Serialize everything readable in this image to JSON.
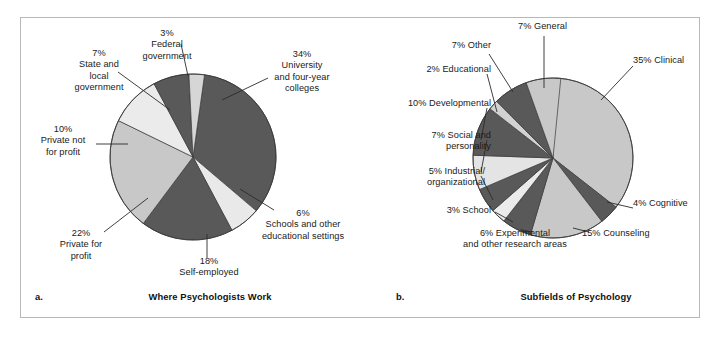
{
  "figure": {
    "background": "#ffffff",
    "frame_color": "#b8b8b8"
  },
  "panels": [
    {
      "letter": "a.",
      "caption": "Where Psychologists Work"
    },
    {
      "letter": "b.",
      "caption": "Subfields of Psychology"
    }
  ],
  "chart_data": [
    {
      "type": "pie",
      "title": "Where Psychologists Work",
      "panel": "a.",
      "units": "percent",
      "total": 100,
      "legend_position": "callout-labels",
      "categories": [
        "University and four-year colleges",
        "Schools and other educational settings",
        "Self-employed",
        "Private for profit",
        "Private not for profit",
        "State and local government",
        "Federal government"
      ],
      "values": [
        34,
        6,
        18,
        22,
        10,
        7,
        3
      ],
      "labels": [
        "34%\nUniversity\nand four-year\ncolleges",
        "6%\nSchools and other\neducational settings",
        "18%\nSelf-employed",
        "22%\nPrivate for\nprofit",
        "10%\nPrivate not\nfor profit",
        "7%\nState and\nlocal\ngovernment",
        "3%\nFederal\ngovernment"
      ],
      "colors": [
        "#595959",
        "#e9e9e9",
        "#595959",
        "#c8c8c8",
        "#ebebeb",
        "#595959",
        "#d6d6d6"
      ]
    },
    {
      "type": "pie",
      "title": "Subfields of Psychology",
      "panel": "b.",
      "units": "percent",
      "total": 100,
      "legend_position": "callout-labels",
      "categories": [
        "Clinical",
        "Cognitive",
        "Counseling",
        "Experimental and other research areas",
        "School",
        "Industrial/organizational",
        "Social and personality",
        "Developmental",
        "Educational",
        "Other",
        "General"
      ],
      "values": [
        35,
        4,
        15,
        6,
        3,
        5,
        7,
        10,
        2,
        7,
        7
      ],
      "labels": [
        "35% Clinical",
        "4% Cognitive",
        "15% Counseling",
        "6% Experimental\nand other research areas",
        "3% School",
        "5% Industrial/\norganizational",
        "7% Social and\npersonality",
        "10% Developmental",
        "2% Educational",
        "7% Other",
        "7% General"
      ],
      "colors": [
        "#c8c8c8",
        "#595959",
        "#c8c8c8",
        "#595959",
        "#ebebeb",
        "#595959",
        "#e4e4e4",
        "#595959",
        "#d2d2d2",
        "#595959",
        "#c8c8c8"
      ]
    }
  ],
  "panel_a_labels": {
    "university": "34%\nUniversity\nand four-year\ncolleges",
    "schools": "6%\nSchools and other\neducational settings",
    "self_employed": "18%\nSelf-employed",
    "private_for_profit": "22%\nPrivate for\nprofit",
    "private_not_for_profit": "10%\nPrivate not\nfor profit",
    "state_local": "7%\nState and\nlocal\ngovernment",
    "federal": "3%\nFederal\ngovernment"
  },
  "panel_b_labels": {
    "general": "7% General",
    "clinical": "35% Clinical",
    "cognitive": "4% Cognitive",
    "counseling": "15% Counseling",
    "experimental": "6% Experimental\nand other research areas",
    "school": "3% School",
    "industrial": "5% Industrial/\norganizational",
    "social": "7% Social and\npersonality",
    "developmental": "10% Developmental",
    "educational": "2% Educational",
    "other": "7% Other"
  }
}
